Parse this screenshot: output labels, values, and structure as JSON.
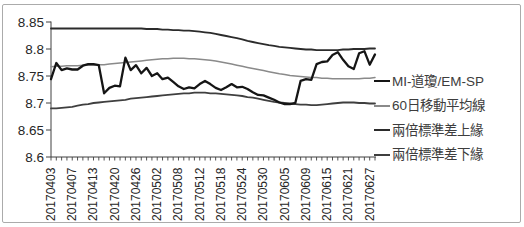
{
  "chart_data": {
    "type": "line",
    "title": "",
    "xlabel": "",
    "ylabel": "",
    "ylim": [
      8.6,
      8.85
    ],
    "yticks": [
      "8.85",
      "8.8",
      "8.75",
      "8.7",
      "8.65",
      "8.6"
    ],
    "ytick_values": [
      8.85,
      8.8,
      8.75,
      8.7,
      8.65,
      8.6
    ],
    "grid": false,
    "legend_position": "right",
    "x_labels": [
      "20170403",
      "20170407",
      "20170413",
      "20170420",
      "20170426",
      "20170502",
      "20170508",
      "20170512",
      "20170518",
      "20170524",
      "20170530",
      "20170605",
      "20170609",
      "20170615",
      "20170621",
      "20170627"
    ],
    "x_label_every": 4,
    "n_points": 62,
    "axis_color": "#404040",
    "series": [
      {
        "name": "MI-道瓊/EM-SP",
        "color": "#151515",
        "width": 2.3,
        "values": [
          8.744,
          8.774,
          8.761,
          8.764,
          8.762,
          8.762,
          8.769,
          8.772,
          8.772,
          8.77,
          8.718,
          8.728,
          8.732,
          8.731,
          8.784,
          8.761,
          8.77,
          8.755,
          8.765,
          8.75,
          8.755,
          8.744,
          8.747,
          8.739,
          8.731,
          8.726,
          8.729,
          8.727,
          8.735,
          8.741,
          8.735,
          8.728,
          8.724,
          8.729,
          8.735,
          8.729,
          8.73,
          8.726,
          8.72,
          8.715,
          8.714,
          8.71,
          8.706,
          8.701,
          8.698,
          8.698,
          8.7,
          8.741,
          8.744,
          8.743,
          8.772,
          8.776,
          8.777,
          8.789,
          8.794,
          8.78,
          8.768,
          8.763,
          8.792,
          8.796,
          8.771,
          8.79
        ]
      },
      {
        "name": "60日移動平均線",
        "color": "#8a8a8a",
        "width": 1.5,
        "values": [
          8.767,
          8.768,
          8.768,
          8.769,
          8.769,
          8.769,
          8.77,
          8.77,
          8.77,
          8.771,
          8.771,
          8.772,
          8.773,
          8.774,
          8.775,
          8.776,
          8.777,
          8.778,
          8.779,
          8.78,
          8.781,
          8.782,
          8.782,
          8.783,
          8.783,
          8.783,
          8.782,
          8.782,
          8.781,
          8.78,
          8.779,
          8.778,
          8.776,
          8.774,
          8.772,
          8.77,
          8.768,
          8.766,
          8.764,
          8.762,
          8.76,
          8.758,
          8.756,
          8.754,
          8.753,
          8.751,
          8.75,
          8.749,
          8.748,
          8.747,
          8.747,
          8.746,
          8.746,
          8.745,
          8.745,
          8.745,
          8.745,
          8.745,
          8.745,
          8.746,
          8.746,
          8.747
        ]
      },
      {
        "name": "兩倍標準差上緣",
        "color": "#2b2b2b",
        "width": 1.8,
        "values": [
          8.838,
          8.838,
          8.838,
          8.838,
          8.838,
          8.838,
          8.838,
          8.838,
          8.838,
          8.838,
          8.838,
          8.838,
          8.838,
          8.838,
          8.838,
          8.838,
          8.838,
          8.838,
          8.837,
          8.837,
          8.837,
          8.836,
          8.836,
          8.835,
          8.835,
          8.834,
          8.834,
          8.833,
          8.832,
          8.831,
          8.83,
          8.828,
          8.826,
          8.824,
          8.822,
          8.82,
          8.818,
          8.815,
          8.813,
          8.811,
          8.809,
          8.807,
          8.806,
          8.804,
          8.803,
          8.802,
          8.801,
          8.8,
          8.799,
          8.799,
          8.798,
          8.798,
          8.798,
          8.798,
          8.798,
          8.799,
          8.799,
          8.8,
          8.8,
          8.8,
          8.801,
          8.801
        ]
      },
      {
        "name": "兩倍標準差下緣",
        "color": "#3f3f3f",
        "width": 1.8,
        "values": [
          8.69,
          8.69,
          8.691,
          8.692,
          8.693,
          8.695,
          8.697,
          8.698,
          8.7,
          8.701,
          8.702,
          8.703,
          8.704,
          8.705,
          8.706,
          8.708,
          8.709,
          8.71,
          8.711,
          8.712,
          8.713,
          8.714,
          8.715,
          8.716,
          8.717,
          8.718,
          8.718,
          8.719,
          8.719,
          8.719,
          8.718,
          8.718,
          8.717,
          8.716,
          8.715,
          8.714,
          8.713,
          8.711,
          8.71,
          8.708,
          8.706,
          8.704,
          8.702,
          8.701,
          8.7,
          8.699,
          8.698,
          8.697,
          8.697,
          8.696,
          8.696,
          8.697,
          8.698,
          8.699,
          8.7,
          8.701,
          8.701,
          8.701,
          8.7,
          8.7,
          8.699,
          8.699
        ]
      }
    ]
  },
  "frame": {
    "background": "#ffffff",
    "border_color": "#ababab"
  }
}
